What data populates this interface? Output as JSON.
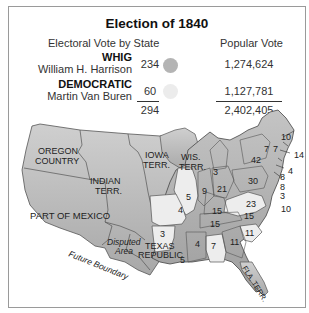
{
  "title": "Election of 1840",
  "headers": {
    "electoral": "Electoral Vote by State",
    "popular": "Popular Vote"
  },
  "parties": [
    {
      "party": "WHIG",
      "candidate": "William H. Harrison",
      "electoral": "234",
      "popular": "1,274,624",
      "color": "#b4b4b4"
    },
    {
      "party": "DEMOCRATIC",
      "candidate": "Martin Van Buren",
      "electoral": "60",
      "popular": "1,127,781",
      "color": "#ececec"
    }
  ],
  "totals": {
    "electoral": "294",
    "popular": "2,402,405"
  },
  "map": {
    "region_labels": {
      "oregon1": "OREGON",
      "oregon2": "COUNTRY",
      "indian1": "INDIAN",
      "indian2": "TERR.",
      "iowa1": "IOWA",
      "iowa2": "TERR.",
      "wis1": "WIS.",
      "wis2": "TERR.",
      "mexico": "PART OF MEXICO",
      "disputed1": "Disputed",
      "disputed2": "Area",
      "texas1": "TEXAS",
      "texas2": "REPUBLIC",
      "future": "Future Boundary",
      "fla": "FLA. TERR."
    },
    "state_votes": {
      "maine": "10",
      "vt": "7",
      "nh": "7",
      "ma": "14",
      "ri": "4",
      "ct": "8",
      "ny": "42",
      "nj": "8",
      "pa": "30",
      "de": "3",
      "md": "10",
      "mi": "3",
      "oh": "21",
      "in": "9",
      "il": "5",
      "mo": "4",
      "ky": "15",
      "va": "23",
      "tn": "15",
      "nc": "15",
      "sc": "11",
      "ga": "11",
      "al": "7",
      "ms": "4",
      "la": "5",
      "ar": "3"
    }
  }
}
